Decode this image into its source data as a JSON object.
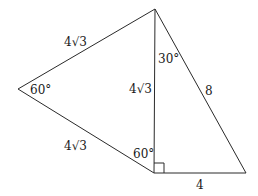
{
  "diagram": {
    "type": "geometry-figure",
    "vertices": {
      "top": [
        155,
        9
      ],
      "left": [
        18,
        89
      ],
      "bottom": [
        154,
        173
      ],
      "right": [
        246,
        173
      ]
    },
    "edges": [
      {
        "name": "top-left-edge",
        "from": "top",
        "to": "left"
      },
      {
        "name": "left-bottom-edge",
        "from": "left",
        "to": "bottom"
      },
      {
        "name": "top-bottom-edge",
        "from": "top",
        "to": "bottom"
      },
      {
        "name": "top-right-edge",
        "from": "top",
        "to": "right"
      },
      {
        "name": "bottom-right-edge",
        "from": "bottom",
        "to": "right"
      }
    ],
    "labels": {
      "side_top_left": "4√3",
      "side_left_bottom": "4√3",
      "side_shared_vertical": "4√3",
      "side_hypotenuse": "8",
      "side_bottom": "4",
      "angle_left": "60°",
      "angle_top_right": "30°",
      "angle_bottom_left": "60°"
    },
    "right_angle_marker": {
      "at": "bottom",
      "size": 10
    }
  }
}
